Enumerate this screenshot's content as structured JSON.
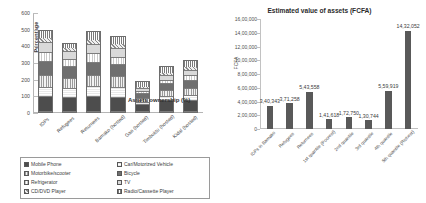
{
  "chart_data": [
    {
      "id": "assets-ownership",
      "type": "bar",
      "stacked": true,
      "title": "Assets ownership (%)",
      "xlabel": "",
      "ylabel": "Percentage",
      "ylim": [
        0,
        600
      ],
      "yticks": [
        "0",
        "100",
        "200",
        "300",
        "400",
        "500",
        "600"
      ],
      "grid": true,
      "legend_position": "bottom",
      "categories": [
        "IDPs",
        "Refugees",
        "Returnees",
        "Bamako (hosted)",
        "Gao (hosted)",
        "Timbuktu (hosted)",
        "Kidal (hosted)"
      ],
      "series": [
        {
          "name": "Mobile Phone",
          "pattern": "p-mobile",
          "values": [
            92,
            88,
            90,
            86,
            42,
            68,
            70
          ]
        },
        {
          "name": "Car/Motorized Vehicle",
          "pattern": "p-car",
          "values": [
            58,
            52,
            62,
            60,
            18,
            24,
            30
          ]
        },
        {
          "name": "Motorbike/scooter",
          "pattern": "p-motor",
          "values": [
            74,
            66,
            72,
            70,
            26,
            38,
            44
          ]
        },
        {
          "name": "Bicycle",
          "pattern": "p-bicycle",
          "values": [
            86,
            74,
            80,
            74,
            28,
            44,
            50
          ]
        },
        {
          "name": "Refrigerator",
          "pattern": "p-fridge",
          "values": [
            52,
            44,
            50,
            46,
            16,
            22,
            28
          ]
        },
        {
          "name": "TV",
          "pattern": "p-tv",
          "values": [
            62,
            48,
            60,
            54,
            20,
            30,
            36
          ]
        },
        {
          "name": "CD/DVD Player",
          "pattern": "p-cd",
          "values": [
            34,
            26,
            32,
            28,
            12,
            18,
            20
          ]
        },
        {
          "name": "Radio/Cassette Player",
          "pattern": "p-radio",
          "values": [
            42,
            22,
            44,
            42,
            30,
            36,
            42
          ]
        }
      ]
    },
    {
      "id": "estimated-value-of-assets",
      "type": "bar",
      "stacked": false,
      "title": "Estimated value of assets (FCFA)",
      "xlabel": "",
      "ylabel": "FCFA",
      "ylim": [
        0,
        1600000
      ],
      "yticks": [
        "16,00,000",
        "14,00,000",
        "12,00,000",
        "10,00,000",
        "8,00,000",
        "6,00,000",
        "4,00,000",
        "2,00,000",
        "0"
      ],
      "grid": false,
      "categories": [
        "IDPs in Bamako",
        "Refugees",
        "Returnees",
        "1st quantile (Poorest)",
        "2nd quantile",
        "3rd quantile",
        "4th quantile",
        "5th quantile (Richest)"
      ],
      "values": [
        340343,
        371258,
        543558,
        141618,
        172750,
        130744,
        559919,
        1432052
      ],
      "value_labels": [
        "3,40,343",
        "3,71,258",
        "5,43,558",
        "1,41,618",
        "1,72,750",
        "1,30,744",
        "5,59,919",
        "14,32,052"
      ],
      "bar_color": "#595959"
    }
  ]
}
